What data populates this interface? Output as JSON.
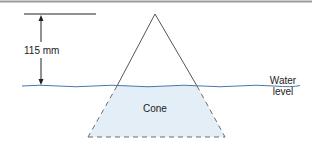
{
  "diagram": {
    "dimension_label": "115 mm",
    "object_label": "Cone",
    "water_label_line1": "Water",
    "water_label_line2": "level",
    "colors": {
      "border": "#9a9a9a",
      "cone_line": "#555555",
      "water_line": "#4a78a8",
      "submerged_fill": "#e3eef7",
      "dashed_line": "#6d6d6d",
      "dimension_line": "#222222"
    }
  }
}
